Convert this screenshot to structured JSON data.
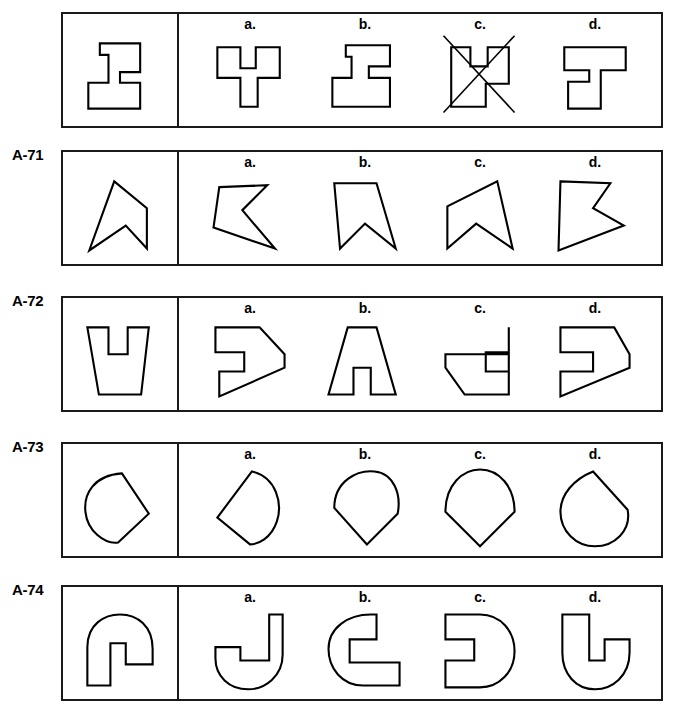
{
  "page": {
    "background_color": "#ffffff",
    "ink_color": "#000000"
  },
  "option_letters": [
    "a.",
    "b.",
    "c.",
    "d."
  ],
  "rows": [
    {
      "label": "",
      "prompt": {
        "name": "z-block-prompt",
        "viewbox": "0 0 100 100",
        "points": "29,16 71,16 71,46 50,46 50,57 71,57 71,84 17,84 17,57 38,57 38,28 29,28",
        "closed": true
      },
      "options": [
        {
          "letter": "a.",
          "name": "z-block-option-a",
          "viewbox": "0 0 100 100",
          "points": "16,20 40,20 40,42 56,42 56,20 81,20 81,52 58,52 58,82 40,82 40,52 16,52",
          "closed": true,
          "struck": false
        },
        {
          "letter": "b.",
          "name": "z-block-option-b",
          "viewbox": "0 0 100 100",
          "points": "30,18 76,18 76,40 54,40 54,52 76,52 76,82 16,82 16,52 36,52 36,30 30,30",
          "closed": true,
          "struck": false
        },
        {
          "letter": "c.",
          "name": "z-block-option-c",
          "viewbox": "0 0 100 100",
          "points": "20,20 40,20 40,40 58,40 58,20 80,20 80,58 56,58 56,82 20,82",
          "closed": true,
          "struck": true,
          "strike_lines": [
            {
              "x1": 12,
              "y1": 8,
              "x2": 86,
              "y2": 88
            },
            {
              "x1": 86,
              "y1": 8,
              "x2": 12,
              "y2": 88
            }
          ]
        },
        {
          "letter": "d.",
          "name": "z-block-option-d",
          "viewbox": "0 0 100 100",
          "points": "18,20 82,20 82,44 56,44 56,84 22,84 22,56 44,56 44,44 18,44",
          "closed": true,
          "struck": false
        }
      ]
    },
    {
      "label": "A-71",
      "prompt": {
        "name": "chevron-prompt",
        "viewbox": "0 0 100 100",
        "points": "44,16 78,44 78,86 56,62 18,88",
        "closed": true
      },
      "options": [
        {
          "letter": "a.",
          "name": "chevron-option-a",
          "viewbox": "0 0 100 100",
          "points": "18,22 68,20 42,46 76,86 12,64",
          "closed": true,
          "struck": false
        },
        {
          "letter": "b.",
          "name": "chevron-option-b",
          "viewbox": "0 0 100 100",
          "points": "18,18 62,18 82,86 50,60 24,86",
          "closed": true,
          "struck": false
        },
        {
          "letter": "c.",
          "name": "chevron-option-c",
          "viewbox": "0 0 100 100",
          "points": "68,16 84,86 46,60 16,86 16,42",
          "closed": true,
          "struck": false
        },
        {
          "letter": "d.",
          "name": "chevron-option-d",
          "viewbox": "0 0 100 100",
          "points": "14,16 66,18 48,44 80,62 12,88",
          "closed": true,
          "struck": false
        }
      ]
    },
    {
      "label": "A-72",
      "prompt": {
        "name": "u-block-prompt",
        "viewbox": "0 0 100 100",
        "points": "16,16 38,16 38,44 58,44 58,16 80,16 72,86 28,86",
        "closed": true
      },
      "options": [
        {
          "letter": "a.",
          "name": "u-block-option-a",
          "viewbox": "0 0 100 100",
          "points": "14,16 60,16 86,44 86,58 18,88 18,62 44,62 44,42 14,42",
          "closed": true,
          "struck": false
        },
        {
          "letter": "b.",
          "name": "u-block-option-b",
          "viewbox": "0 0 100 100",
          "points": "32,16 62,16 82,86 56,86 56,58 38,58 38,86 12,86",
          "closed": true,
          "struck": false
        },
        {
          "letter": "c.",
          "name": "u-block-option-c",
          "viewbox": "0 0 100 100",
          "points": "80,16 80,86 34,86 14,58 14,44 80,44 80,62 56,62 56,42 80,42",
          "closed": true,
          "struck": false
        },
        {
          "letter": "d.",
          "name": "u-block-option-d",
          "viewbox": "0 0 100 100",
          "points": "14,16 70,16 86,44 86,58 14,88 14,62 48,62 48,42 14,42",
          "closed": true,
          "struck": false
        }
      ]
    },
    {
      "label": "A-73",
      "prompt": {
        "name": "teardrop-prompt",
        "viewbox": "0 0 100 100",
        "path": "M 52,16 C 22,18 12,38 14,56 C 16,76 34,90 48,88 L 80,58 Z",
        "closed": true
      },
      "options": [
        {
          "letter": "a.",
          "name": "teardrop-option-a",
          "viewbox": "0 0 100 100",
          "path": "M 52,14 C 78,20 84,48 78,66 C 72,84 58,90 50,90 L 16,62 Z",
          "closed": true,
          "struck": false
        },
        {
          "letter": "b.",
          "name": "teardrop-option-b",
          "viewbox": "0 0 100 100",
          "path": "M 18,52 C 18,24 42,12 60,14 C 80,16 88,38 84,58 L 52,90 Z",
          "closed": true,
          "struck": false
        },
        {
          "letter": "c.",
          "name": "teardrop-option-c",
          "viewbox": "0 0 100 100",
          "path": "M 14,56 C 14,28 32,12 50,12 C 70,12 86,30 86,56 L 50,92 Z",
          "closed": true,
          "struck": false
        },
        {
          "letter": "d.",
          "name": "teardrop-option-d",
          "viewbox": "0 0 100 100",
          "path": "M 48,14 L 84,54 C 88,76 70,92 50,92 C 30,92 14,76 14,56 C 14,38 28,22 48,14 Z",
          "closed": true,
          "struck": false
        }
      ]
    },
    {
      "label": "A-74",
      "prompt": {
        "name": "arch-block-prompt",
        "viewbox": "0 0 100 100",
        "path": "M 16,88 L 16,48 C 16,24 34,14 50,14 C 68,14 84,26 84,50 L 84,66 L 56,66 L 56,44 L 40,44 L 40,88 Z",
        "closed": true
      },
      "options": [
        {
          "letter": "a.",
          "name": "arch-block-option-a",
          "viewbox": "0 0 100 100",
          "path": "M 70,14 L 84,14 L 84,56 C 84,78 66,92 48,92 C 28,92 14,78 14,60 L 14,48 L 40,48 L 40,62 L 70,62 Z",
          "closed": true,
          "struck": false
        },
        {
          "letter": "b.",
          "name": "arch-block-option-b",
          "viewbox": "0 0 100 100",
          "path": "M 62,14 L 62,40 L 34,40 L 34,64 L 86,64 L 86,88 L 48,88 C 26,88 12,70 12,50 C 12,28 32,14 56,14 Z",
          "closed": true,
          "struck": false
        },
        {
          "letter": "c.",
          "name": "arch-block-option-c",
          "viewbox": "0 0 100 100",
          "path": "M 14,14 L 50,14 C 72,14 86,32 86,52 C 86,74 70,90 50,90 L 14,90 L 14,62 L 44,62 L 44,40 L 14,40 Z",
          "closed": true,
          "struck": false
        },
        {
          "letter": "d.",
          "name": "arch-block-option-d",
          "viewbox": "0 0 100 100",
          "path": "M 16,14 L 44,14 L 44,62 L 60,62 L 60,40 L 86,40 L 86,54 C 86,78 68,92 50,92 C 30,92 16,76 16,54 Z",
          "closed": true,
          "struck": false
        }
      ]
    }
  ]
}
